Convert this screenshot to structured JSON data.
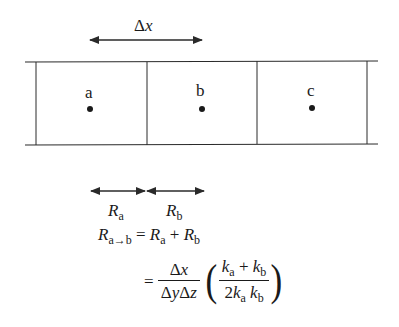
{
  "diagram": {
    "type": "1D finite-volume cells with thermal resistance",
    "cells": [
      {
        "label": "a"
      },
      {
        "label": "b"
      },
      {
        "label": "c"
      }
    ],
    "spacing": {
      "symbol": "Δ",
      "var": "x"
    },
    "resistances": [
      {
        "R": "R",
        "sub": "a"
      },
      {
        "R": "R",
        "sub": "b"
      }
    ],
    "equation": {
      "line1": {
        "lhs": "R",
        "lhs_sub": "a→b",
        "eq": "=",
        "t1": "R",
        "t1_sub": "a",
        "plus": "+",
        "t2": "R",
        "t2_sub": "b"
      },
      "line2": {
        "eq": "=",
        "frac1_num": "Δx",
        "frac1_den": "ΔyΔz",
        "frac2_num_k1": "k",
        "frac2_num_k1_sub": "a",
        "frac2_num_plus": "+",
        "frac2_num_k2": "k",
        "frac2_num_k2_sub": "b",
        "frac2_den_coef": "2",
        "frac2_den_k1": "k",
        "frac2_den_k1_sub": "a",
        "frac2_den_k2": "k",
        "frac2_den_k2_sub": "b",
        "lparen": "(",
        "rparen": ")"
      }
    },
    "colors": {
      "line": "#2a2a2a",
      "background": "#ffffff"
    }
  }
}
